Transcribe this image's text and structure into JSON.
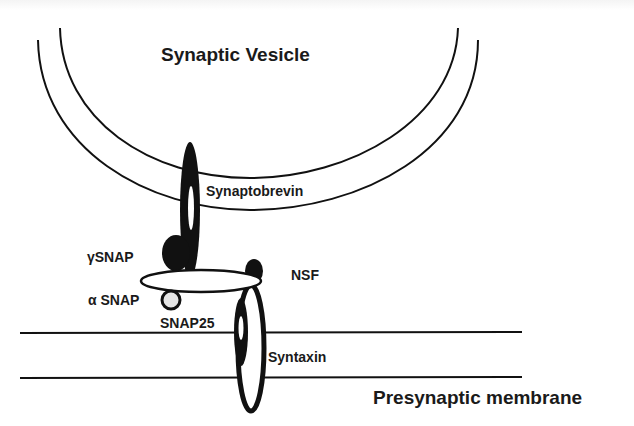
{
  "diagram": {
    "type": "biology-schematic",
    "colors": {
      "ink": "#111111",
      "fill": "#ffffff",
      "accent_circle": "#dcdcdc"
    },
    "labels": {
      "vesicle": "Synaptic Vesicle",
      "synaptobrevin": "Synaptobrevin",
      "gamma_snap": "γSNAP",
      "nsf": "NSF",
      "alpha_snap": "α SNAP",
      "snap25": "SNAP25",
      "syntaxin": "Syntaxin",
      "membrane": "Presynaptic membrane"
    },
    "nodes": [
      {
        "id": "synaptic-vesicle",
        "label": "Synaptic Vesicle",
        "shape": "double-arc"
      },
      {
        "id": "synaptobrevin",
        "label": "Synaptobrevin",
        "shape": "vertical-ellipse"
      },
      {
        "id": "gamma-snap",
        "label": "γSNAP",
        "shape": "filled-ellipse"
      },
      {
        "id": "nsf",
        "label": "NSF",
        "shape": "horizontal-ellipse"
      },
      {
        "id": "alpha-snap",
        "label": "α SNAP",
        "shape": "circle"
      },
      {
        "id": "snap25",
        "label": "SNAP25",
        "shape": "filled-ellipse"
      },
      {
        "id": "syntaxin",
        "label": "Syntaxin",
        "shape": "vertical-ellipse"
      },
      {
        "id": "presynaptic-membrane",
        "label": "Presynaptic membrane",
        "shape": "double-line"
      }
    ]
  }
}
